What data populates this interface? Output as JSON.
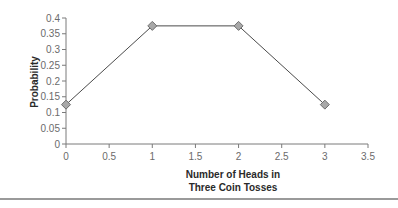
{
  "chart_data": {
    "type": "line",
    "title": "",
    "xlabel": "Number of Heads in Three Coin Tosses",
    "xlabel_lines": [
      "Number of Heads in",
      "Three Coin Tosses"
    ],
    "ylabel": "Probability",
    "x": [
      0,
      1,
      2,
      3
    ],
    "series": [
      {
        "name": "Probability",
        "values": [
          0.125,
          0.375,
          0.375,
          0.125
        ]
      }
    ],
    "xlim": [
      0,
      3.5
    ],
    "ylim": [
      0,
      0.4
    ],
    "x_ticks": [
      "0",
      "0.5",
      "1",
      "1.5",
      "2",
      "2.5",
      "3",
      "3.5"
    ],
    "y_ticks": [
      "0",
      "0.05",
      "0.1",
      "0.15",
      "0.2",
      "0.25",
      "0.3",
      "0.35",
      "0.4"
    ],
    "grid": false,
    "legend": "none",
    "marker": "diamond",
    "colors": {
      "line": "#4a4a4a",
      "marker_fill": "#a8a8a8",
      "marker_stroke": "#6e6e6e",
      "axis": "#7a7a7a"
    }
  }
}
